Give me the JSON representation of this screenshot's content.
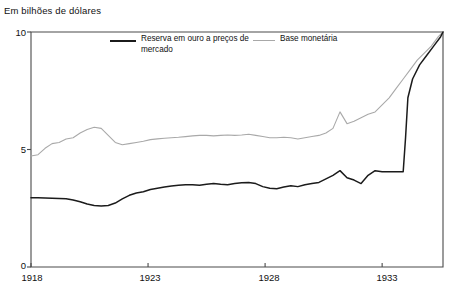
{
  "chart_data": {
    "type": "line",
    "title": "",
    "ylabel": "Em bilhões de dólares",
    "xlabel": "",
    "ylim": [
      0,
      10
    ],
    "xlim": [
      1918,
      1935.6
    ],
    "grid": false,
    "legend_position": "top-inside",
    "ytick_labels": [
      "0",
      "5",
      "10"
    ],
    "ytick_values": [
      0,
      5,
      10
    ],
    "xtick_labels": [
      "1918",
      "1923",
      "1928",
      "1933"
    ],
    "xtick_values": [
      1918,
      1923,
      1928,
      1933
    ],
    "series": [
      {
        "name": "Reserva em ouro a preços de mercado",
        "color": "#1b1b1b",
        "x": [
          1918.0,
          1918.3,
          1918.6,
          1918.9,
          1919.2,
          1919.5,
          1919.8,
          1920.1,
          1920.4,
          1920.7,
          1921.0,
          1921.3,
          1921.6,
          1921.9,
          1922.2,
          1922.5,
          1922.8,
          1923.1,
          1923.4,
          1923.7,
          1924.0,
          1924.3,
          1924.6,
          1924.9,
          1925.2,
          1925.5,
          1925.8,
          1926.1,
          1926.4,
          1926.7,
          1927.0,
          1927.3,
          1927.6,
          1927.9,
          1928.2,
          1928.5,
          1928.8,
          1929.1,
          1929.4,
          1929.7,
          1930.0,
          1930.3,
          1930.6,
          1930.9,
          1931.2,
          1931.5,
          1931.8,
          1932.1,
          1932.4,
          1932.7,
          1933.0,
          1933.3,
          1933.6,
          1933.9,
          1934.0,
          1934.1,
          1934.3,
          1934.6,
          1934.9,
          1935.2,
          1935.5,
          1935.6
        ],
        "y": [
          2.95,
          2.95,
          2.94,
          2.93,
          2.92,
          2.9,
          2.85,
          2.78,
          2.68,
          2.62,
          2.6,
          2.62,
          2.72,
          2.9,
          3.05,
          3.15,
          3.2,
          3.3,
          3.35,
          3.4,
          3.45,
          3.48,
          3.5,
          3.5,
          3.48,
          3.52,
          3.55,
          3.52,
          3.5,
          3.55,
          3.58,
          3.6,
          3.55,
          3.42,
          3.35,
          3.33,
          3.4,
          3.46,
          3.42,
          3.5,
          3.55,
          3.6,
          3.75,
          3.9,
          4.1,
          3.8,
          3.7,
          3.55,
          3.9,
          4.1,
          4.05,
          4.05,
          4.05,
          4.05,
          5.5,
          7.2,
          8.0,
          8.6,
          9.0,
          9.4,
          9.8,
          10.0
        ]
      },
      {
        "name": "Base monetária",
        "color": "#a9a9a9",
        "x": [
          1918.0,
          1918.3,
          1918.6,
          1918.9,
          1919.2,
          1919.5,
          1919.8,
          1920.1,
          1920.4,
          1920.7,
          1921.0,
          1921.3,
          1921.6,
          1921.9,
          1922.2,
          1922.5,
          1922.8,
          1923.1,
          1923.4,
          1923.7,
          1924.0,
          1924.3,
          1924.6,
          1924.9,
          1925.2,
          1925.5,
          1925.8,
          1926.1,
          1926.4,
          1926.7,
          1927.0,
          1927.3,
          1927.6,
          1927.9,
          1928.2,
          1928.5,
          1928.8,
          1929.1,
          1929.4,
          1929.7,
          1930.0,
          1930.3,
          1930.6,
          1930.9,
          1931.2,
          1931.5,
          1931.8,
          1932.1,
          1932.4,
          1932.7,
          1933.0,
          1933.3,
          1933.6,
          1933.9,
          1934.2,
          1934.5,
          1934.8,
          1935.1,
          1935.4,
          1935.6
        ],
        "y": [
          4.72,
          4.78,
          5.05,
          5.25,
          5.3,
          5.45,
          5.5,
          5.7,
          5.85,
          5.95,
          5.9,
          5.6,
          5.3,
          5.2,
          5.25,
          5.3,
          5.35,
          5.42,
          5.45,
          5.48,
          5.5,
          5.52,
          5.55,
          5.58,
          5.6,
          5.6,
          5.58,
          5.6,
          5.62,
          5.6,
          5.62,
          5.65,
          5.6,
          5.55,
          5.5,
          5.5,
          5.52,
          5.5,
          5.45,
          5.5,
          5.55,
          5.6,
          5.7,
          5.9,
          6.6,
          6.1,
          6.2,
          6.35,
          6.5,
          6.6,
          6.9,
          7.2,
          7.6,
          8.0,
          8.4,
          8.8,
          9.1,
          9.4,
          9.8,
          10.0
        ]
      }
    ],
    "legend": [
      {
        "label": "Reserva em ouro a preços de mercado",
        "color": "#1b1b1b",
        "style": "thick-solid"
      },
      {
        "label": "Base monetária",
        "color": "#a9a9a9",
        "style": "thin-solid"
      }
    ],
    "annotations": []
  },
  "footer": {
    "note": ""
  }
}
